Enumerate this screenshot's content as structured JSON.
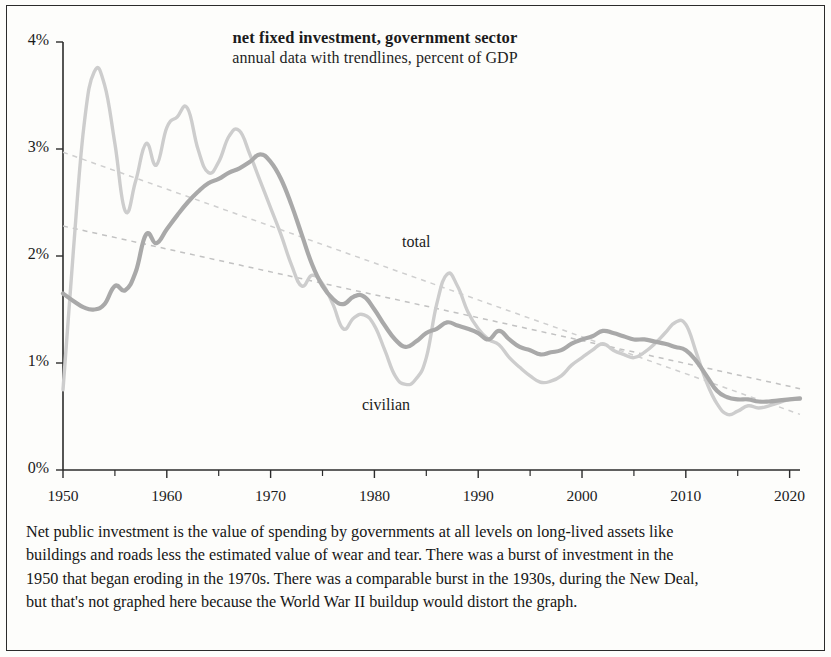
{
  "chart_data": {
    "type": "line",
    "title": "net fixed investment, government sector",
    "subtitle": "annual data with trendlines, percent of GDP",
    "xlabel": "",
    "ylabel": "percent of GDP",
    "xlim": [
      1950,
      2021
    ],
    "ylim": [
      0,
      4
    ],
    "grid": false,
    "legend_position": "inline-annotation",
    "y_ticks": [
      "0%",
      "1%",
      "2%",
      "3%",
      "4%"
    ],
    "y_tick_values": [
      0,
      1,
      2,
      3,
      4
    ],
    "x_ticks": [
      "1950",
      "1960",
      "1970",
      "1980",
      "1990",
      "2000",
      "2010",
      "2020"
    ],
    "x_tick_values": [
      1950,
      1960,
      1970,
      1980,
      1990,
      2000,
      2010,
      2020
    ],
    "x_minor_tick_values": [
      1955,
      1965,
      1975,
      1985,
      1995,
      2005,
      2015
    ],
    "annotations": [
      {
        "text": "total",
        "x": 1983,
        "y": 2.15
      },
      {
        "text": "civilian",
        "x": 1979,
        "y": 0.83
      }
    ],
    "colors": {
      "total": "#cdcdcd",
      "civilian": "#a9a9a9",
      "trendline_total": "#cfcfcf",
      "trendline_civilian": "#c2c2c2",
      "axis": "#2b2b2b",
      "text": "#1b1b1b",
      "frame": "#2b2b2b",
      "background": "#fdfdfb"
    },
    "x": [
      1950,
      1951,
      1952,
      1953,
      1954,
      1955,
      1956,
      1957,
      1958,
      1959,
      1960,
      1961,
      1962,
      1963,
      1964,
      1965,
      1966,
      1967,
      1968,
      1969,
      1970,
      1971,
      1972,
      1973,
      1974,
      1975,
      1976,
      1977,
      1978,
      1979,
      1980,
      1981,
      1982,
      1983,
      1984,
      1985,
      1986,
      1987,
      1988,
      1989,
      1990,
      1991,
      1992,
      1993,
      1994,
      1995,
      1996,
      1997,
      1998,
      1999,
      2000,
      2001,
      2002,
      2003,
      2004,
      2005,
      2006,
      2007,
      2008,
      2009,
      2010,
      2011,
      2012,
      2013,
      2014,
      2015,
      2016,
      2017,
      2018,
      2019,
      2020,
      2021
    ],
    "series": [
      {
        "name": "total",
        "color": "#cdcdcd",
        "values": [
          0.75,
          2.05,
          3.2,
          3.72,
          3.6,
          3.05,
          2.42,
          2.7,
          3.05,
          2.85,
          3.2,
          3.3,
          3.38,
          3.0,
          2.78,
          2.88,
          3.12,
          3.17,
          2.95,
          2.7,
          2.45,
          2.2,
          1.92,
          1.72,
          1.82,
          1.74,
          1.55,
          1.32,
          1.42,
          1.45,
          1.35,
          1.12,
          0.88,
          0.8,
          0.85,
          1.05,
          1.55,
          1.83,
          1.72,
          1.48,
          1.32,
          1.22,
          1.17,
          1.05,
          0.96,
          0.88,
          0.82,
          0.83,
          0.88,
          0.98,
          1.05,
          1.12,
          1.18,
          1.12,
          1.08,
          1.05,
          1.1,
          1.18,
          1.28,
          1.38,
          1.36,
          1.1,
          0.82,
          0.62,
          0.52,
          0.55,
          0.6,
          0.58,
          0.6,
          0.63,
          0.66,
          0.66
        ]
      },
      {
        "name": "civilian",
        "color": "#a9a9a9",
        "values": [
          1.65,
          1.58,
          1.52,
          1.5,
          1.55,
          1.72,
          1.68,
          1.85,
          2.2,
          2.12,
          2.25,
          2.38,
          2.5,
          2.6,
          2.68,
          2.72,
          2.78,
          2.82,
          2.88,
          2.95,
          2.88,
          2.72,
          2.48,
          2.2,
          1.92,
          1.72,
          1.6,
          1.55,
          1.62,
          1.62,
          1.5,
          1.35,
          1.22,
          1.15,
          1.2,
          1.28,
          1.32,
          1.38,
          1.35,
          1.32,
          1.28,
          1.22,
          1.3,
          1.22,
          1.15,
          1.12,
          1.08,
          1.1,
          1.12,
          1.18,
          1.22,
          1.25,
          1.3,
          1.28,
          1.25,
          1.22,
          1.22,
          1.2,
          1.18,
          1.15,
          1.12,
          1.02,
          0.88,
          0.74,
          0.68,
          0.66,
          0.66,
          0.64,
          0.64,
          0.65,
          0.66,
          0.67
        ]
      }
    ],
    "trendlines": [
      {
        "name": "total trendline",
        "style": "dashed",
        "color": "#cfcfcf",
        "x_start": 1950,
        "y_start": 2.97,
        "x_end": 2021,
        "y_end": 0.52
      },
      {
        "name": "civilian trendline",
        "style": "dashed",
        "color": "#c2c2c2",
        "x_start": 1950,
        "y_start": 2.28,
        "x_end": 2021,
        "y_end": 0.76
      }
    ]
  },
  "caption": {
    "line1": "Net public investment is the value of spending by governments at all levels on long-lived assets like",
    "line2": "buildings and roads less the estimated value of wear and tear. There was a burst of investment in the",
    "line3": "1950 that began eroding in the 1970s. There was a comparable burst in the 1930s, during the New Deal,",
    "line4": "but that's not graphed here because the World War II buildup would distort the graph."
  }
}
